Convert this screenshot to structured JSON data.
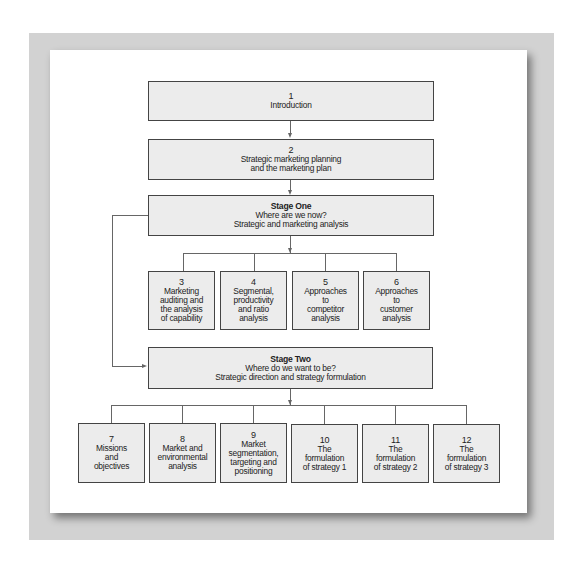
{
  "diagram": {
    "top_boxes": [
      {
        "number": "1",
        "lines": [
          "Introduction"
        ]
      },
      {
        "number": "2",
        "lines": [
          "Strategic marketing planning",
          "and the marketing plan"
        ]
      }
    ],
    "stage_one": {
      "title": "Stage One",
      "lines": [
        "Where are we now?",
        "Strategic and marketing analysis"
      ],
      "children": [
        {
          "number": "3",
          "lines": [
            "Marketing",
            "auditing and",
            "the analysis",
            "of capability"
          ]
        },
        {
          "number": "4",
          "lines": [
            "Segmental,",
            "productivity",
            "and ratio",
            "analysis"
          ]
        },
        {
          "number": "5",
          "lines": [
            "Approaches",
            "to",
            "competitor",
            "analysis"
          ]
        },
        {
          "number": "6",
          "lines": [
            "Approaches",
            "to",
            "customer",
            "analysis"
          ]
        }
      ]
    },
    "stage_two": {
      "title": "Stage Two",
      "lines": [
        "Where do we want to be?",
        "Strategic direction and strategy formulation"
      ],
      "children": [
        {
          "number": "7",
          "lines": [
            "Missions",
            "and",
            "objectives"
          ]
        },
        {
          "number": "8",
          "lines": [
            "Market and",
            "environmental",
            "analysis"
          ]
        },
        {
          "number": "9",
          "lines": [
            "Market",
            "segmentation,",
            "targeting and",
            "positioning"
          ]
        },
        {
          "number": "10",
          "lines": [
            "The",
            "formulation",
            "of strategy 1"
          ]
        },
        {
          "number": "11",
          "lines": [
            "The",
            "formulation",
            "of strategy 2"
          ]
        },
        {
          "number": "12",
          "lines": [
            "The",
            "formulation",
            "of strategy 3"
          ]
        }
      ]
    },
    "colors": {
      "frame": "#d2d2d2",
      "box_fill": "#ececec",
      "box_border": "#444444",
      "connector": "#666666"
    }
  }
}
